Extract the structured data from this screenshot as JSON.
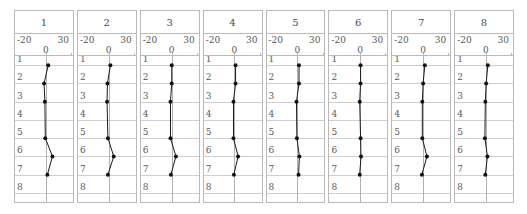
{
  "figure": {
    "type": "trellis-dot-plot",
    "panel_count": 8,
    "rows_per_panel": 8
  },
  "axis": {
    "left_label": "-20",
    "right_label": "30",
    "zero_label": "0",
    "min": -20,
    "max": 30,
    "zero": 0
  },
  "row_labels": [
    "1",
    "2",
    "3",
    "4",
    "5",
    "6",
    "7",
    "8"
  ],
  "colors": {
    "marker": "#111111",
    "line": "#1a1a1a",
    "grid": "#cfcfcf",
    "panel_border": "#b9b9b9",
    "reference_line": "#b0b0b0",
    "text": "#4a4a4a",
    "background": "#ffffff"
  },
  "chart_data": {
    "type": "line",
    "title": "",
    "subtitle": "",
    "xlabel": "",
    "ylabel": "",
    "xlim": [
      -20,
      30
    ],
    "ylim": [
      1,
      8
    ],
    "grid": true,
    "legend": "none",
    "orientation": "horizontal-value-vertical-category",
    "categories": [
      "1",
      "2",
      "3",
      "4",
      "5",
      "6",
      "7",
      "8"
    ],
    "xticks": [
      -20,
      0,
      30
    ],
    "xticklabels": [
      "-20",
      "0",
      "30"
    ],
    "panels": [
      {
        "label": "1",
        "values": [
          3,
          -2,
          -1,
          null,
          -0.5,
          8,
          2,
          null
        ],
        "points": [
          {
            "row": 1,
            "x": 3
          },
          {
            "row": 2,
            "x": -2
          },
          {
            "row": 3,
            "x": -1
          },
          {
            "row": 5,
            "x": -0.5
          },
          {
            "row": 6,
            "x": 8
          },
          {
            "row": 7,
            "x": 2
          }
        ]
      },
      {
        "label": "2",
        "values": [
          2,
          -1.5,
          -2,
          null,
          -1,
          6,
          -1,
          null
        ],
        "points": [
          {
            "row": 1,
            "x": 2
          },
          {
            "row": 2,
            "x": -1.5
          },
          {
            "row": 3,
            "x": -2
          },
          {
            "row": 5,
            "x": -1
          },
          {
            "row": 6,
            "x": 6
          },
          {
            "row": 7,
            "x": -1
          }
        ]
      },
      {
        "label": "3",
        "values": [
          0,
          0,
          -1.5,
          null,
          -1.5,
          5,
          -1,
          null
        ],
        "points": [
          {
            "row": 1,
            "x": 0
          },
          {
            "row": 2,
            "x": 0
          },
          {
            "row": 3,
            "x": -1.5
          },
          {
            "row": 5,
            "x": -1.5
          },
          {
            "row": 6,
            "x": 5
          },
          {
            "row": 7,
            "x": -1
          }
        ]
      },
      {
        "label": "4",
        "values": [
          1,
          1,
          -1.5,
          null,
          -1.5,
          4,
          -1,
          null
        ],
        "points": [
          {
            "row": 1,
            "x": 1
          },
          {
            "row": 2,
            "x": 1
          },
          {
            "row": 3,
            "x": -1.5
          },
          {
            "row": 5,
            "x": -1.5
          },
          {
            "row": 6,
            "x": 4
          },
          {
            "row": 7,
            "x": -1
          }
        ]
      },
      {
        "label": "5",
        "values": [
          1.5,
          1.5,
          -1.5,
          null,
          -1,
          2,
          1,
          null
        ],
        "points": [
          {
            "row": 1,
            "x": 1.5
          },
          {
            "row": 2,
            "x": 1.5
          },
          {
            "row": 3,
            "x": -1.5
          },
          {
            "row": 5,
            "x": -1
          },
          {
            "row": 6,
            "x": 2
          },
          {
            "row": 7,
            "x": 1
          }
        ]
      },
      {
        "label": "6",
        "values": [
          1,
          1,
          0,
          null,
          1,
          1.5,
          0,
          null
        ],
        "points": [
          {
            "row": 1,
            "x": 1
          },
          {
            "row": 2,
            "x": 1
          },
          {
            "row": 3,
            "x": 0
          },
          {
            "row": 5,
            "x": 1
          },
          {
            "row": 6,
            "x": 1.5
          },
          {
            "row": 7,
            "x": 0
          }
        ]
      },
      {
        "label": "7",
        "values": [
          2.5,
          0.5,
          -0.5,
          null,
          -0.5,
          5,
          -1,
          null
        ],
        "points": [
          {
            "row": 1,
            "x": 2.5
          },
          {
            "row": 2,
            "x": 0.5
          },
          {
            "row": 3,
            "x": -0.5
          },
          {
            "row": 5,
            "x": -0.5
          },
          {
            "row": 6,
            "x": 5
          },
          {
            "row": 7,
            "x": -1
          }
        ]
      },
      {
        "label": "8",
        "values": [
          2.5,
          0.5,
          -0.5,
          null,
          -1,
          2,
          -0.5,
          null
        ],
        "points": [
          {
            "row": 1,
            "x": 2.5
          },
          {
            "row": 2,
            "x": 0.5
          },
          {
            "row": 3,
            "x": -0.5
          },
          {
            "row": 5,
            "x": -1
          },
          {
            "row": 6,
            "x": 2
          },
          {
            "row": 7,
            "x": -0.5
          }
        ]
      }
    ]
  }
}
